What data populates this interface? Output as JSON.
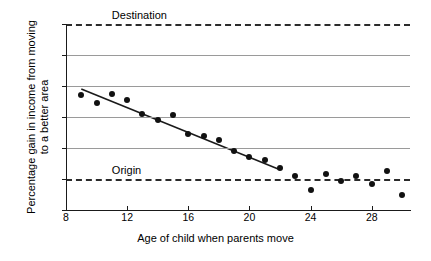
{
  "chart_data": {
    "type": "scatter",
    "title": "",
    "xlabel": "Age of child when parents move",
    "ylabel_line1": "Percentage gain in income from moving",
    "ylabel_line2": "to a better area",
    "xlim": [
      8,
      30.5
    ],
    "ylim": [
      -20,
      100
    ],
    "xticks": [
      8,
      12,
      16,
      20,
      24,
      28
    ],
    "xtick_labels": [
      "8",
      "12",
      "16",
      "20",
      "24",
      "28"
    ],
    "yticks": [
      -20,
      0,
      20,
      40,
      60,
      80,
      100
    ],
    "ytick_labels": [
      "-20",
      "0",
      "20",
      "40",
      "60",
      "80",
      "100"
    ],
    "grid": "horizontal",
    "legend_position": "none",
    "x": [
      9,
      10,
      11,
      12,
      13,
      14,
      15,
      16,
      17,
      18,
      19,
      20,
      21,
      22,
      23,
      24,
      25,
      26,
      27,
      28,
      29,
      30
    ],
    "values": [
      54,
      49,
      55,
      51,
      42,
      38,
      41,
      29,
      28,
      25,
      18,
      14,
      12,
      7,
      2,
      -7,
      3,
      -1,
      2,
      -3,
      5,
      -10
    ],
    "series": [
      {
        "name": "Percentage gain in income from moving to a better area",
        "x": [
          9,
          10,
          11,
          12,
          13,
          14,
          15,
          16,
          17,
          18,
          19,
          20,
          21,
          22,
          23,
          24,
          25,
          26,
          27,
          28,
          29,
          30
        ],
        "values": [
          54,
          49,
          55,
          51,
          42,
          38,
          41,
          29,
          28,
          25,
          18,
          14,
          12,
          7,
          2,
          -7,
          3,
          -1,
          2,
          -3,
          5,
          -10
        ]
      }
    ],
    "fit_line": {
      "name": "linear fit",
      "x": [
        9,
        22
      ],
      "y": [
        58,
        6
      ]
    },
    "reference_lines": [
      {
        "name": "Destination",
        "label": "Destination",
        "y": 100,
        "style": "dashed",
        "label_x": 11.0
      },
      {
        "name": "Origin",
        "label": "Origin",
        "y": 0,
        "style": "dashed",
        "label_x": 11.0
      }
    ],
    "colors": {
      "point": "#111111",
      "fit_line": "#1a1a1a",
      "gridline": "#9a9a9a",
      "reference_line": "#2b2b2b",
      "axis": "#1a1a1a"
    }
  }
}
